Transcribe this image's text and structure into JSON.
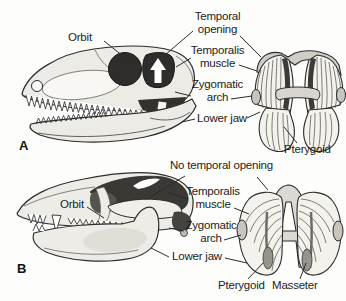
{
  "figure": {
    "colors": {
      "ink": "#2b2b2b",
      "bone_light": "#edebe6",
      "opening_dark": "#2e2d2b",
      "muscle_light": "#f3f2ed",
      "background": "#fdfdfc"
    },
    "panels": [
      {
        "letter": "A",
        "labels": {
          "orbit": "Orbit",
          "temporal_opening": "Temporal opening",
          "temporalis_muscle": "Temporalis muscle",
          "zygomatic_arch": "Zygomatic arch",
          "lower_jaw": "Lower jaw",
          "pterygoid": "Pterygoid"
        }
      },
      {
        "letter": "B",
        "labels": {
          "no_temporal_opening": "No temporal opening",
          "orbit": "Orbit",
          "temporalis_muscle": "Temporalis muscle",
          "zygomatic_arch": "Zygomatic arch",
          "lower_jaw": "Lower jaw",
          "pterygoid": "Pterygoid",
          "masseter": "Masseter"
        }
      }
    ]
  }
}
